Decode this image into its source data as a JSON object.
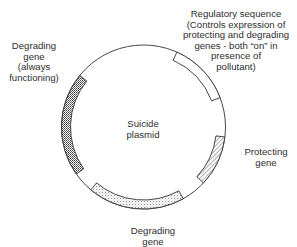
{
  "diagram": {
    "title": "Suicide plasmid",
    "center_label": [
      "Suicide",
      "plasmid"
    ],
    "plasmid": {
      "cx": 143.5,
      "cy": 127,
      "r": 82,
      "band": 9,
      "stroke": "#333333"
    },
    "segments": [
      {
        "id": "degrading-gene-always",
        "label_lines": [
          "Degrading",
          "gene",
          "(always",
          "functioning)"
        ],
        "start_deg": 145,
        "end_deg": 219,
        "pattern": "dense-dots"
      },
      {
        "id": "regulatory-sequence",
        "label_lines": [
          "Regulatory sequence",
          "(Controls expression of",
          "protecting and degrading",
          "genes - both “on” in",
          "presence of",
          "pollutant)"
        ],
        "start_deg": -66,
        "end_deg": -21,
        "pattern": "none"
      },
      {
        "id": "protecting-gene",
        "label_lines": [
          "Protecting",
          "gene"
        ],
        "start_deg": 7,
        "end_deg": 43,
        "pattern": "hatch"
      },
      {
        "id": "degrading-gene",
        "label_lines": [
          "Degrading",
          "gene"
        ],
        "start_deg": 61,
        "end_deg": 130,
        "pattern": "light-dots"
      }
    ]
  }
}
